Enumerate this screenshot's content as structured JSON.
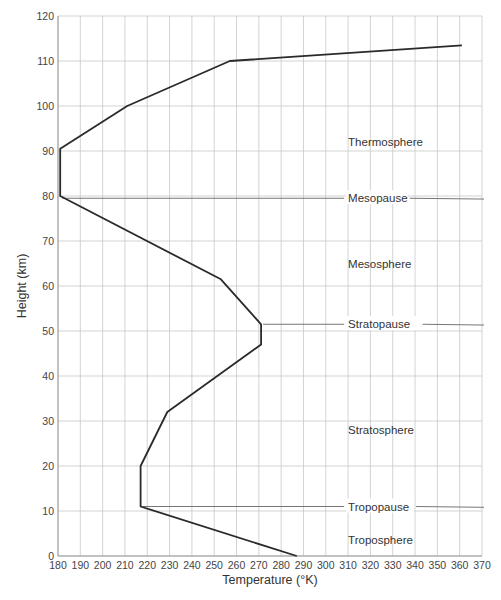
{
  "chart_data": {
    "type": "line",
    "title": "",
    "xlabel": "Temperature (°K)",
    "ylabel": "Height (km)",
    "xlim": [
      180,
      370
    ],
    "ylim": [
      0,
      120
    ],
    "grid": true,
    "x_ticks": [
      180,
      190,
      200,
      210,
      220,
      230,
      240,
      250,
      260,
      270,
      280,
      290,
      300,
      310,
      320,
      330,
      340,
      350,
      360,
      370
    ],
    "y_ticks": [
      0,
      10,
      20,
      30,
      40,
      50,
      60,
      70,
      80,
      90,
      100,
      110,
      120
    ],
    "series": [
      {
        "name": "Temperature profile",
        "points": [
          {
            "temp": 287,
            "height": 0
          },
          {
            "temp": 217,
            "height": 11
          },
          {
            "temp": 217,
            "height": 20
          },
          {
            "temp": 229,
            "height": 32
          },
          {
            "temp": 271,
            "height": 47
          },
          {
            "temp": 271,
            "height": 51.5
          },
          {
            "temp": 253,
            "height": 61.5
          },
          {
            "temp": 181,
            "height": 80
          },
          {
            "temp": 181,
            "height": 90.5
          },
          {
            "temp": 211,
            "height": 100
          },
          {
            "temp": 257,
            "height": 110
          },
          {
            "temp": 361,
            "height": 113.5
          }
        ]
      }
    ],
    "annotations": [
      {
        "text": "Thermosphere",
        "type": "layer",
        "height": 92
      },
      {
        "text": "Mesopause",
        "type": "boundary",
        "height": 79.5,
        "line_start_temp": 181
      },
      {
        "text": "Mesosphere",
        "type": "layer",
        "height": 65
      },
      {
        "text": "Stratopause",
        "type": "boundary",
        "height": 51.5,
        "line_start_temp": 271
      },
      {
        "text": "Stratosphere",
        "type": "layer",
        "height": 28
      },
      {
        "text": "Tropopause",
        "type": "boundary",
        "height": 11,
        "line_start_temp": 217
      },
      {
        "text": "Troposphere",
        "type": "layer",
        "height": 3.5
      }
    ],
    "legend": null
  },
  "labels": {
    "xlabel": "Temperature (°K)",
    "ylabel": "Height (km)"
  },
  "colors": {
    "line": "#2a2a2a",
    "grid": "#c8c8c8",
    "boundary": "#666666"
  }
}
